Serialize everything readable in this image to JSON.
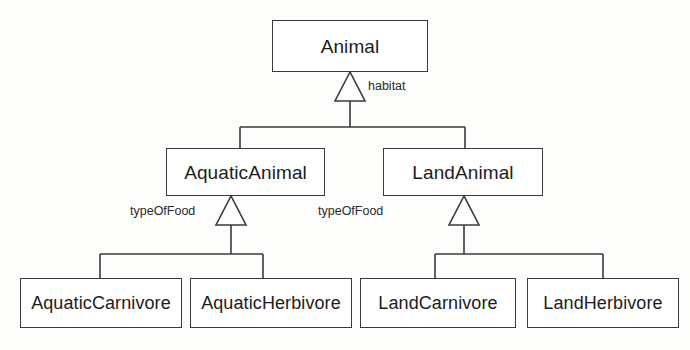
{
  "diagram": {
    "kind": "uml-class-diagram",
    "notation": "generalization",
    "background_color": "#fdfdfc",
    "stroke_color": "#3a3a3a",
    "text_color": "#1c1c1c",
    "classes": {
      "root": {
        "name": "Animal",
        "x": 272,
        "y": 20,
        "w": 156,
        "h": 52
      },
      "aquatic": {
        "name": "AquaticAnimal",
        "x": 166,
        "y": 148,
        "w": 159,
        "h": 48
      },
      "land": {
        "name": "LandAnimal",
        "x": 383,
        "y": 148,
        "w": 160,
        "h": 48
      },
      "aquatic_carnivore": {
        "name": "AquaticCarnivore",
        "x": 20,
        "y": 278,
        "w": 162,
        "h": 50
      },
      "aquatic_herbivore": {
        "name": "AquaticHerbivore",
        "x": 190,
        "y": 278,
        "w": 162,
        "h": 50
      },
      "land_carnivore": {
        "name": "LandCarnivore",
        "x": 360,
        "y": 278,
        "w": 156,
        "h": 50
      },
      "land_herbivore": {
        "name": "LandHerbivore",
        "x": 527,
        "y": 278,
        "w": 152,
        "h": 50
      }
    },
    "discriminators": {
      "habitat": {
        "label": "habitat",
        "x": 368,
        "y": 80
      },
      "type_of_food_aquatic": {
        "label": "typeOfFood",
        "x": 130,
        "y": 205
      },
      "type_of_food_land": {
        "label": "typeOfFood",
        "x": 318,
        "y": 205
      }
    },
    "generalizations": [
      {
        "parent": "Animal",
        "children": [
          "AquaticAnimal",
          "LandAnimal"
        ],
        "discriminator": "habitat"
      },
      {
        "parent": "AquaticAnimal",
        "children": [
          "AquaticCarnivore",
          "AquaticHerbivore"
        ],
        "discriminator": "typeOfFood"
      },
      {
        "parent": "LandAnimal",
        "children": [
          "LandCarnivore",
          "LandHerbivore"
        ],
        "discriminator": "typeOfFood"
      }
    ]
  }
}
